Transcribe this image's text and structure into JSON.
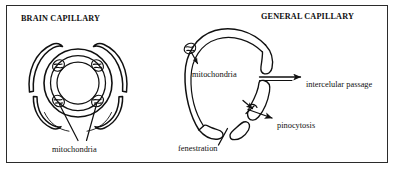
{
  "figure": {
    "kind": "scientific-line-diagram",
    "background_color": "#ffffff",
    "stroke_color": "#101010",
    "border_color": "#2b2b2b",
    "width": 398,
    "height": 173
  },
  "panels": {
    "left": {
      "title": "BRAIN CAPILLARY",
      "structure": "concentric endothelial ring with four mitochondria and surrounding astrocyte end-feet arcs",
      "labels": [
        {
          "id": "mitochondria",
          "text": "mitochondria"
        }
      ]
    },
    "right": {
      "title": "GENERAL CAPILLARY",
      "structure": "open endothelial ring with gaps showing fenestration, intercellular passage and pinocytotic vesicles",
      "labels": [
        {
          "id": "mitochondria",
          "text": "mitochondria"
        },
        {
          "id": "intercellular-passage",
          "text": "intercelular passage"
        },
        {
          "id": "pinocytosis",
          "text": "pinocytosis"
        },
        {
          "id": "fenestration",
          "text": "fenestration"
        }
      ]
    }
  },
  "annotations": {
    "brain_mitochondria": "mitochondria",
    "general_mitochondria": "mitochondria",
    "intercellular_passage": "intercelular passage",
    "pinocytosis": "pinocytosis",
    "fenestration": "fenestration"
  }
}
